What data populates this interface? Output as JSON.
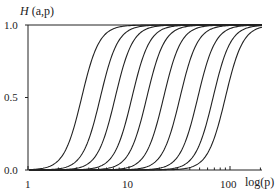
{
  "chart_data": {
    "type": "line",
    "title": "",
    "ylabel": "H (a,p)",
    "xlabel": "log(p)",
    "xscale": "log",
    "xlim": [
      1,
      220
    ],
    "ylim": [
      0.0,
      1.0
    ],
    "x_ticks": [
      1,
      10,
      100
    ],
    "x_tick_labels": [
      "1",
      "10",
      "100"
    ],
    "y_ticks": [
      0.0,
      0.5,
      1.0
    ],
    "y_tick_labels": [
      "0.0",
      "0.5",
      "1.0"
    ],
    "grid": false,
    "legend": null,
    "line_color": "#222222",
    "series_description": "Ten sigmoid curves H(a,p) vs log(p), shifted right for increasing a; each rises from 0 to 1",
    "series": [
      {
        "name": "curve 1",
        "midpoint_p": 3.4,
        "steepness": 5.0
      },
      {
        "name": "curve 2",
        "midpoint_p": 5.2,
        "steepness": 5.0
      },
      {
        "name": "curve 3",
        "midpoint_p": 7.3,
        "steepness": 5.0
      },
      {
        "name": "curve 4",
        "midpoint_p": 10.7,
        "steepness": 5.0
      },
      {
        "name": "curve 5",
        "midpoint_p": 15,
        "steepness": 5.0
      },
      {
        "name": "curve 6",
        "midpoint_p": 22,
        "steepness": 5.0
      },
      {
        "name": "curve 7",
        "midpoint_p": 32,
        "steepness": 5.0
      },
      {
        "name": "curve 8",
        "midpoint_p": 48,
        "steepness": 5.0
      },
      {
        "name": "curve 9",
        "midpoint_p": 68,
        "steepness": 5.0
      },
      {
        "name": "curve 10",
        "midpoint_p": 90,
        "steepness": 5.0
      }
    ]
  },
  "labels": {
    "y_axis_title_H": "H",
    "y_axis_title_args": "(a,p)",
    "x_axis_title": "log(p)",
    "y_tick_0": "0.0",
    "y_tick_05": "0.5",
    "y_tick_1": "1.0",
    "x_tick_1": "1",
    "x_tick_10": "10",
    "x_tick_100": "100"
  }
}
